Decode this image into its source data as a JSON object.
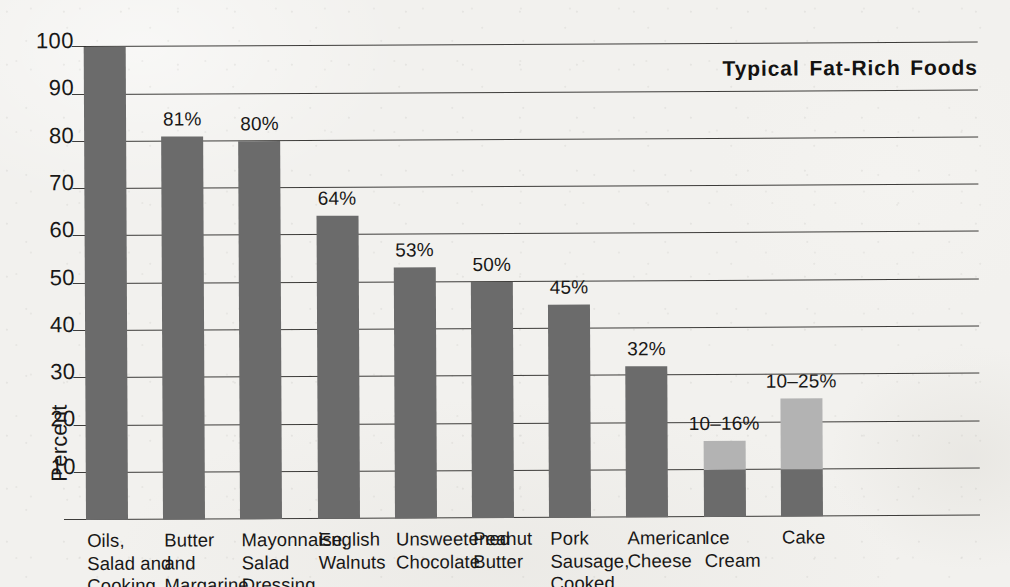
{
  "chart_data": {
    "type": "bar",
    "title": "Typical Fat-Rich Foods",
    "xlabel": "",
    "ylabel": "Percent",
    "ylim": [
      0,
      100
    ],
    "ytick_labels": [
      "100",
      "90",
      "80",
      "70",
      "60",
      "50",
      "40",
      "30",
      "20",
      "10"
    ],
    "ytick_values": [
      100,
      90,
      80,
      70,
      60,
      50,
      40,
      30,
      20,
      10
    ],
    "grid": true,
    "legend": "none",
    "categories": [
      "Oils,\nSalad and\nCooking",
      "Butter\nand\nMargarine",
      "Mayonnaise,\nSalad\nDressing",
      "English\nWalnuts",
      "Unsweetened\nChocolate",
      "Peanut\nButter",
      "Pork\nSausage,\nCooked",
      "American\nCheese",
      "Ice\nCream",
      "Cake"
    ],
    "values": [
      100,
      81,
      80,
      64,
      53,
      50,
      45,
      32,
      16,
      25
    ],
    "value_labels": [
      "",
      "81%",
      "80%",
      "64%",
      "53%",
      "50%",
      "45%",
      "32%",
      "10–16%",
      "10–25%"
    ],
    "ranged_bars": [
      {
        "category": "Ice Cream",
        "low": 10,
        "high": 16
      },
      {
        "category": "Cake",
        "low": 10,
        "high": 25
      }
    ],
    "colors": {
      "bar_dark": "#6b6b6b",
      "bar_light": "#b3b3b3",
      "paper": "#f2f1ee",
      "ink": "#191817"
    }
  }
}
